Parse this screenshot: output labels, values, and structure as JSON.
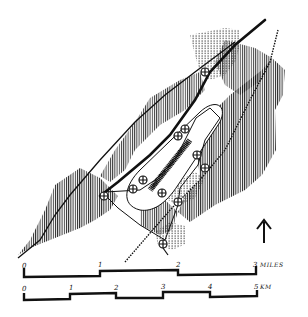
{
  "map": {
    "type": "hand-drawn site map",
    "north_arrow": {
      "label": "",
      "direction": "up"
    },
    "features": [
      {
        "name": "main-road",
        "style": "thick line"
      },
      {
        "name": "railway",
        "style": "cross-hatched line"
      },
      {
        "name": "loop-road",
        "style": "thin line"
      },
      {
        "name": "runway-oval",
        "style": "outlined oval"
      },
      {
        "name": "stippled-areas",
        "style": "dotted fill"
      },
      {
        "name": "hatched-areas",
        "style": "vertical line hatching"
      },
      {
        "name": "junction-markers",
        "count": 11,
        "style": "circled crosses"
      }
    ]
  },
  "scale_miles": {
    "ticks": [
      "0",
      "1",
      "2",
      "3"
    ],
    "unit": "MILES"
  },
  "scale_km": {
    "ticks": [
      "0",
      "1",
      "2",
      "3",
      "4",
      "5"
    ],
    "unit": "KM"
  }
}
